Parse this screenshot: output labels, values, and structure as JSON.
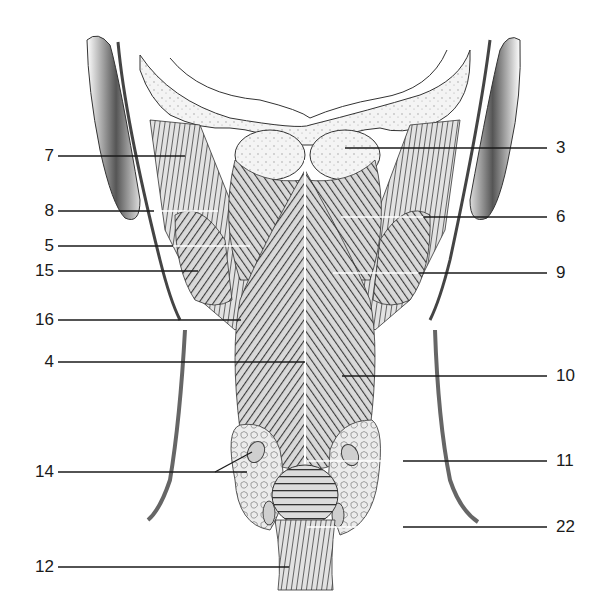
{
  "figure": {
    "colors": {
      "ink": "#1a1a1a",
      "shade": "#555555",
      "light": "#d8d8d8",
      "bone": "#efefef",
      "background": "#ffffff"
    }
  },
  "labels": {
    "left": [
      {
        "text": "7",
        "y": 156,
        "line_x1": 58,
        "line_x2": 185,
        "line_color": "dark"
      },
      {
        "text": "8",
        "y": 211,
        "line_x1": 58,
        "line_x2": 218,
        "line_color": "mixed"
      },
      {
        "text": "5",
        "y": 246,
        "line_x1": 58,
        "line_x2": 250,
        "line_color": "mixed"
      },
      {
        "text": "15",
        "y": 271,
        "line_x1": 58,
        "line_x2": 198,
        "line_color": "dark"
      },
      {
        "text": "16",
        "y": 320,
        "line_x1": 58,
        "line_x2": 241,
        "line_color": "dark"
      },
      {
        "text": "4",
        "y": 362,
        "line_x1": 58,
        "line_x2": 305,
        "line_color": "dark"
      },
      {
        "text": "14",
        "y": 472,
        "line_x1": 58,
        "line_x2": 247,
        "line_color": "dark",
        "branch_to": [
          252,
          452
        ]
      },
      {
        "text": "12",
        "y": 567,
        "line_x1": 58,
        "line_x2": 289,
        "line_color": "dark"
      }
    ],
    "right": [
      {
        "text": "3",
        "y": 148,
        "line_x1": 345,
        "line_x2": 547,
        "line_color": "dark"
      },
      {
        "text": "6",
        "y": 217,
        "line_x1": 341,
        "line_x2": 547,
        "line_color": "mixed"
      },
      {
        "text": "9",
        "y": 273,
        "line_x1": 333,
        "line_x2": 547,
        "line_color": "mixed"
      },
      {
        "text": "10",
        "y": 376,
        "line_x1": 342,
        "line_x2": 547,
        "line_color": "dark"
      },
      {
        "text": "11",
        "y": 461,
        "line_x1": 307,
        "line_x2": 547,
        "line_color": "mixed"
      },
      {
        "text": "22",
        "y": 527,
        "line_x1": 307,
        "line_x2": 547,
        "line_color": "mixed"
      }
    ]
  }
}
